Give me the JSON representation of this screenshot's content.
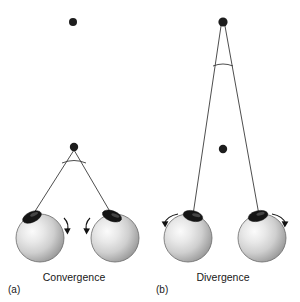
{
  "figure": {
    "background_color": "#ffffff",
    "width": 300,
    "height": 302
  },
  "panels": [
    {
      "id": "a",
      "id_label": "(a)",
      "caption": "Convergence",
      "caption_x": 74,
      "caption_y": 281,
      "id_x": 8,
      "id_y": 293,
      "fixation_description": "near point fixated",
      "dots": [
        {
          "name": "far-target-dot",
          "x": 73,
          "y": 22,
          "r": 4.0,
          "fixated": false
        },
        {
          "name": "near-fixation-dot",
          "x": 74,
          "y": 147,
          "r": 4.2,
          "fixated": true
        }
      ],
      "vergence_point": {
        "x": 74,
        "y": 149
      },
      "angle_arc": {
        "cx": 74,
        "cy": 149,
        "r": 14,
        "start_deg": 250,
        "end_deg": 290
      },
      "eyes": [
        {
          "name": "left-eye",
          "cx": 40,
          "cy": 238,
          "r": 24,
          "pupil_cx": 32,
          "pupil_cy": 217,
          "pupil_rx": 9.5,
          "pupil_ry": 5.0,
          "pupil_rot": -22,
          "sightline_to": {
            "x": 74,
            "y": 149
          },
          "rotation_direction": "clockwise-inward",
          "arrow": {
            "x": 68,
            "y": 224,
            "dir": "down-right"
          }
        },
        {
          "name": "right-eye",
          "cx": 115,
          "cy": 238,
          "r": 24,
          "pupil_cx": 110,
          "pupil_cy": 216,
          "pupil_rx": 9.5,
          "pupil_ry": 5.0,
          "pupil_rot": 18,
          "sightline_to": {
            "x": 74,
            "y": 149
          },
          "rotation_direction": "counterclockwise-inward",
          "arrow": {
            "x": 92,
            "y": 224,
            "dir": "down-left"
          }
        }
      ]
    },
    {
      "id": "b",
      "id_label": "(b)",
      "caption": "Divergence",
      "caption_x": 223,
      "caption_y": 281,
      "id_x": 156,
      "id_y": 293,
      "fixation_description": "far point fixated",
      "dots": [
        {
          "name": "far-fixation-dot",
          "x": 223,
          "y": 22,
          "r": 4.6,
          "fixated": true
        },
        {
          "name": "near-target-dot",
          "x": 223,
          "y": 149,
          "r": 4.2,
          "fixated": false
        }
      ],
      "vergence_point": {
        "x": 223,
        "y": 24
      },
      "angle_arc": {
        "cx": 223,
        "cy": 24,
        "r": 42,
        "start_deg": 258,
        "end_deg": 282
      },
      "eyes": [
        {
          "name": "left-eye",
          "cx": 188,
          "cy": 238,
          "r": 24,
          "pupil_cx": 193,
          "pupil_cy": 216,
          "pupil_rx": 9.5,
          "pupil_ry": 5.0,
          "pupil_rot": 15,
          "sightline_to": {
            "x": 223,
            "y": 24
          },
          "rotation_direction": "counterclockwise-outward",
          "arrow": {
            "x": 163,
            "y": 222,
            "dir": "left-down"
          }
        },
        {
          "name": "right-eye",
          "cx": 262,
          "cy": 238,
          "r": 24,
          "pupil_cx": 258,
          "pupil_cy": 216,
          "pupil_rx": 9.5,
          "pupil_ry": 5.0,
          "pupil_rot": -12,
          "sightline_to": {
            "x": 223,
            "y": 24
          },
          "rotation_direction": "clockwise-outward",
          "arrow": {
            "x": 288,
            "y": 222,
            "dir": "right-down"
          }
        }
      ]
    }
  ],
  "colors": {
    "line": "#3a3a3a",
    "dot": "#1d1d1d",
    "text": "#171717",
    "eye_light": "#f2f2f2",
    "eye_mid": "#c9c9c9",
    "eye_dark": "#8d8d8d",
    "pupil": "#151515"
  }
}
